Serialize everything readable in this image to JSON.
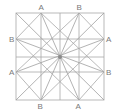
{
  "diagram": {
    "type": "geometric-construction",
    "square": {
      "left": 16,
      "top": 13,
      "right": 104,
      "bottom": 100
    },
    "center": {
      "x": 60,
      "y": 57
    },
    "colors": {
      "line": "#a8a8a8",
      "label": "#7a7a7a",
      "center_dot": "#8a8a8a"
    },
    "labels": {
      "top_left": "A",
      "top_right": "B",
      "left_top": "B",
      "left_bottom": "A",
      "right_top": "A",
      "right_bottom": "B",
      "bottom_left": "B",
      "bottom_right": "A"
    },
    "points": {
      "top_A": [
        41,
        13
      ],
      "top_B": [
        79,
        13
      ],
      "left_B": [
        16,
        39
      ],
      "left_A": [
        16,
        72
      ],
      "right_A": [
        104,
        39
      ],
      "right_B": [
        104,
        72
      ],
      "bottom_B": [
        41,
        100
      ],
      "bottom_A": [
        79,
        100
      ]
    }
  }
}
